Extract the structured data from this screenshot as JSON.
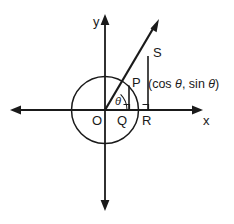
{
  "figure": {
    "background_color": "#ffffff",
    "stroke_color": "#1a1a1a",
    "axes": {
      "x_label": "x",
      "y_label": "y"
    },
    "points": {
      "origin_label": "O",
      "q_label": "Q",
      "r_label": "R",
      "p_label": "P",
      "s_label": "S"
    },
    "angle": {
      "label": "θ"
    },
    "annotation": {
      "open_paren": "(",
      "cos_text": "cos",
      "theta_1": "θ",
      "comma": ",",
      "sin_text": "sin",
      "theta_2": "θ",
      "close_paren": ")"
    }
  }
}
